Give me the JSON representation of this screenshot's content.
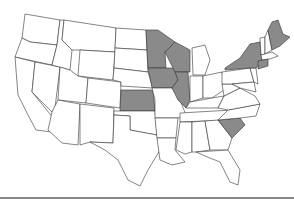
{
  "map": {
    "type": "choropleth",
    "region": "United States",
    "fill_colors": {
      "highlighted": "#8a8a8a",
      "default": "#ffffff",
      "border": "#333333"
    },
    "highlighted_states": [
      "Minnesota",
      "Wisconsin",
      "Iowa",
      "Illinois",
      "Kansas",
      "New York",
      "Maine",
      "Connecticut",
      "South Carolina"
    ]
  }
}
